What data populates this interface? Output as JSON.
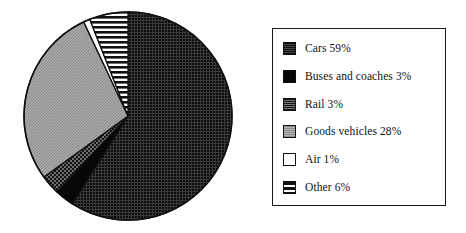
{
  "chart_data": {
    "type": "pie",
    "title": "",
    "subtitle": "",
    "xlabel": "",
    "ylabel": "",
    "legend_position": "right",
    "grid": false,
    "start_angle_deg": 0,
    "direction": "clockwise",
    "units": "%",
    "categories": [
      "Cars",
      "Buses and coaches",
      "Rail",
      "Goods vehicles",
      "Air",
      "Other"
    ],
    "values": [
      59,
      3,
      3,
      28,
      1,
      6
    ],
    "slices": [
      {
        "label": "Cars",
        "value": 59,
        "value_text": "59%",
        "legend_text": "Cars 59%",
        "pattern": "dense-dot",
        "fill": "#2b2b2b",
        "pattern_ink": "#111111",
        "pattern_paper": "#3d3d3d"
      },
      {
        "label": "Buses and coaches",
        "value": 3,
        "value_text": "3%",
        "legend_text": "Buses and coaches 3%",
        "pattern": "solid",
        "fill": "#080808",
        "pattern_ink": "#080808",
        "pattern_paper": "#080808"
      },
      {
        "label": "Rail",
        "value": 3,
        "value_text": "3%",
        "legend_text": "Rail 3%",
        "pattern": "checker",
        "fill": "#4a4a4a",
        "pattern_ink": "#1a1a1a",
        "pattern_paper": "#707070"
      },
      {
        "label": "Goods vehicles",
        "value": 28,
        "value_text": "28%",
        "legend_text": "Goods vehicles 28%",
        "pattern": "light-grain",
        "fill": "#9d9d9d",
        "pattern_ink": "#8a8a8a",
        "pattern_paper": "#a8a8a8"
      },
      {
        "label": "Air",
        "value": 1,
        "value_text": "1%",
        "legend_text": "Air 1%",
        "pattern": "blank",
        "fill": "#ffffff",
        "pattern_ink": "#ffffff",
        "pattern_paper": "#ffffff"
      },
      {
        "label": "Other",
        "value": 6,
        "value_text": "6%",
        "legend_text": "Other 6%",
        "pattern": "horizontal-stripe",
        "fill": "#ffffff",
        "pattern_ink": "#111111",
        "pattern_paper": "#ffffff"
      }
    ]
  },
  "legend": {
    "items": [
      {
        "label": "Cars 59%"
      },
      {
        "label": "Buses and coaches 3%"
      },
      {
        "label": "Rail 3%"
      },
      {
        "label": "Goods vehicles 28%"
      },
      {
        "label": "Air 1%"
      },
      {
        "label": "Other 6%"
      }
    ]
  },
  "colors": {
    "outline": "#111111",
    "background": "#ffffff"
  }
}
